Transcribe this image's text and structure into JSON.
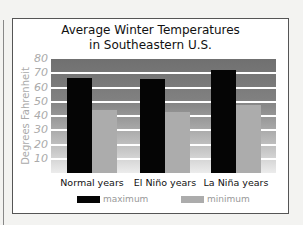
{
  "chart_data": {
    "type": "bar",
    "title_lines": [
      "Average Winter Temperatures",
      "in Southeastern U.S."
    ],
    "categories": [
      "Normal years",
      "El Niño years",
      "La Niña years"
    ],
    "series": [
      {
        "name": "maximum",
        "color": "#050505",
        "values": [
          67,
          66,
          72
        ]
      },
      {
        "name": "minimum",
        "color": "#acacac",
        "values": [
          44,
          43,
          48
        ]
      }
    ],
    "xlabel": "",
    "ylabel": "Degrees Fahrenheit",
    "ylim": [
      0,
      80
    ],
    "yticks": [
      10,
      20,
      30,
      40,
      50,
      60,
      70,
      80
    ],
    "grid": true,
    "legend_position": "bottom"
  }
}
